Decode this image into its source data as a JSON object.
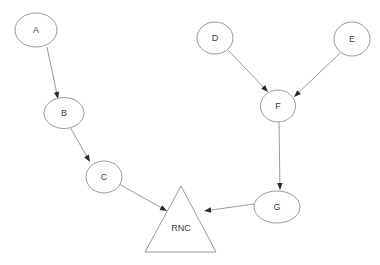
{
  "diagram": {
    "background_color": "#ffffff",
    "node_stroke_color": "#9a9a9a",
    "node_fill_color": "#ffffff",
    "edge_color": "#8f8f8f",
    "arrowhead_color": "#2a2a2a",
    "label_color": "#3a3a3a",
    "nodes": [
      {
        "id": "A",
        "label": "A",
        "shape": "ellipse",
        "cx": 36,
        "cy": 30,
        "rx": 21,
        "ry": 17
      },
      {
        "id": "B",
        "label": "B",
        "shape": "ellipse",
        "cx": 64,
        "cy": 113,
        "rx": 20,
        "ry": 15.5
      },
      {
        "id": "C",
        "label": "C",
        "shape": "ellipse",
        "cx": 104,
        "cy": 177,
        "rx": 18,
        "ry": 16
      },
      {
        "id": "D",
        "label": "D",
        "shape": "ellipse",
        "cx": 215,
        "cy": 38,
        "rx": 18,
        "ry": 16
      },
      {
        "id": "E",
        "label": "E",
        "shape": "ellipse",
        "cx": 352,
        "cy": 39,
        "rx": 18,
        "ry": 17
      },
      {
        "id": "F",
        "label": "F",
        "shape": "ellipse",
        "cx": 278,
        "cy": 106,
        "rx": 17.5,
        "ry": 16
      },
      {
        "id": "G",
        "label": "G",
        "shape": "ellipse",
        "cx": 277,
        "cy": 207,
        "rx": 23,
        "ry": 16
      },
      {
        "id": "RNC",
        "label": "RNC",
        "shape": "triangle",
        "apex_x": 181,
        "apex_y": 186,
        "base_left_x": 145,
        "base_right_x": 216,
        "base_y": 252,
        "label_x": 181,
        "label_y": 228
      }
    ],
    "edges": [
      {
        "from": "A",
        "to": "B",
        "x1": 47,
        "y1": 47,
        "x2": 58,
        "y2": 99
      },
      {
        "from": "B",
        "to": "C",
        "x1": 70,
        "y1": 127,
        "x2": 90,
        "y2": 162
      },
      {
        "from": "C",
        "to": "RNC",
        "x1": 119,
        "y1": 184,
        "x2": 167,
        "y2": 211
      },
      {
        "from": "D",
        "to": "F",
        "x1": 228,
        "y1": 50,
        "x2": 268,
        "y2": 92
      },
      {
        "from": "E",
        "to": "F",
        "x1": 340,
        "y1": 53,
        "x2": 294,
        "y2": 97
      },
      {
        "from": "F",
        "to": "G",
        "x1": 279,
        "y1": 122,
        "x2": 280,
        "y2": 190
      },
      {
        "from": "G",
        "to": "RNC",
        "x1": 254,
        "y1": 204,
        "x2": 204,
        "y2": 211
      }
    ]
  }
}
